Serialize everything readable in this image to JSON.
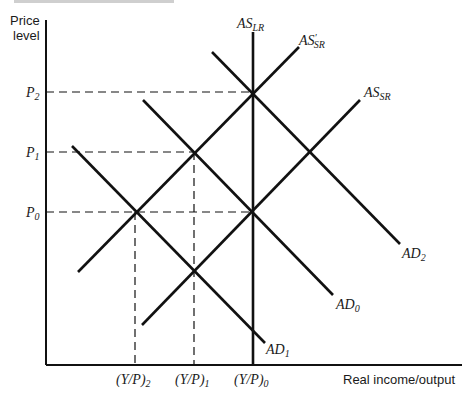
{
  "diagram": {
    "y_axis_label_line1": "Price",
    "y_axis_label_line2": "level",
    "x_axis_label": "Real income/output",
    "price_levels": [
      {
        "label": "P",
        "sub": "2",
        "y": 92
      },
      {
        "label": "P",
        "sub": "1",
        "y": 152
      },
      {
        "label": "P",
        "sub": "0",
        "y": 212
      }
    ],
    "output_levels": [
      {
        "label": "(Y/P)",
        "sub": "2",
        "x": 135
      },
      {
        "label": "(Y/P)",
        "sub": "1",
        "x": 194
      },
      {
        "label": "(Y/P)",
        "sub": "0",
        "x": 253
      }
    ],
    "curves": {
      "AS_LR": {
        "label": "AS",
        "sub": "LR",
        "prime": ""
      },
      "AS_SR_prime": {
        "label": "AS",
        "sub": "SR",
        "prime": "′"
      },
      "AS_SR": {
        "label": "AS",
        "sub": "SR",
        "prime": ""
      },
      "AD_2": {
        "label": "AD",
        "sub": "2"
      },
      "AD_0": {
        "label": "AD",
        "sub": "0"
      },
      "AD_1": {
        "label": "AD",
        "sub": "1"
      }
    },
    "stroke_color": "#111111"
  }
}
